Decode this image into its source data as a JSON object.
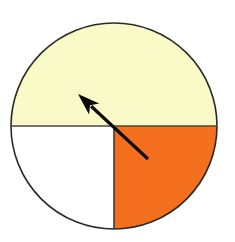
{
  "figure": {
    "title": "Circle divided into shaded sectors with pointer arrow",
    "canvas": {
      "width": 235,
      "height": 242,
      "background_color": "#FFFFFF"
    },
    "circle": {
      "center_x": 114,
      "center_y": 126,
      "radius": 103,
      "outline_color": "#2B2B26",
      "outline_width": 1.6
    },
    "sectors": [
      {
        "name": "top-half-sector",
        "label": "Top half",
        "start_angle_deg": 180,
        "end_angle_deg": 360,
        "sweep_deg": 180,
        "fraction": 0.5,
        "fill_color": "#FAFAC8"
      },
      {
        "name": "bottom-right-sector",
        "label": "Bottom right quadrant",
        "start_angle_deg": 0,
        "end_angle_deg": 90,
        "sweep_deg": 90,
        "fraction": 0.25,
        "fill_color": "#F4701E"
      },
      {
        "name": "bottom-left-sector",
        "label": "Bottom left quadrant",
        "start_angle_deg": 90,
        "end_angle_deg": 180,
        "sweep_deg": 90,
        "fraction": 0.25,
        "fill_color": "#FFFFFF"
      }
    ],
    "dividers": [
      {
        "name": "horizontal-divider",
        "x1": 11,
        "y1": 126,
        "x2": 217,
        "y2": 126,
        "color": "#4A4A3C",
        "width": 1.6
      },
      {
        "name": "vertical-divider",
        "x1": 114,
        "y1": 126,
        "x2": 114,
        "y2": 229,
        "color": "#3A3A33",
        "width": 1.6
      }
    ],
    "arrow": {
      "name": "pointer-arrow",
      "label": "Pointer arrow",
      "tail_x": 148,
      "tail_y": 159,
      "tip_x": 78,
      "tip_y": 94,
      "color": "#0A0A0A",
      "shaft_width": 3.2,
      "head_length": 22,
      "head_width": 15,
      "direction_deg": 137
    }
  },
  "chart_data": {
    "type": "pie",
    "title": "Circle divided into shaded sectors with pointer arrow",
    "categories": [
      "Top half",
      "Bottom right quadrant",
      "Bottom left quadrant"
    ],
    "values": [
      0.5,
      0.25,
      0.25
    ],
    "colors": [
      "#FAFAC8",
      "#F4701E",
      "#FFFFFF"
    ],
    "xlabel": "",
    "ylabel": "",
    "legend": "none",
    "grid": false,
    "annotations": [
      {
        "type": "arrow",
        "text": "",
        "from": [
          148,
          159
        ],
        "to": [
          78,
          94
        ],
        "points_into": "Top half"
      }
    ]
  }
}
